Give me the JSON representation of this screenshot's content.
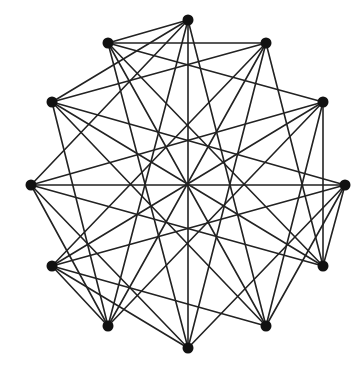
{
  "diagram": {
    "type": "graph",
    "directed": false,
    "colors": {
      "edge": "#222222",
      "node": "#111111",
      "background": "#ffffff"
    },
    "node_radius": 5.5,
    "nodes": [
      {
        "id": "V0",
        "x": 188,
        "y": 20
      },
      {
        "id": "V1",
        "x": 266,
        "y": 43
      },
      {
        "id": "V2",
        "x": 323,
        "y": 102
      },
      {
        "id": "V3",
        "x": 345,
        "y": 185
      },
      {
        "id": "V4",
        "x": 323,
        "y": 266
      },
      {
        "id": "V5",
        "x": 266,
        "y": 326
      },
      {
        "id": "V6",
        "x": 188,
        "y": 348
      },
      {
        "id": "V7",
        "x": 108,
        "y": 326
      },
      {
        "id": "V8",
        "x": 52,
        "y": 266
      },
      {
        "id": "V9",
        "x": 31,
        "y": 185
      },
      {
        "id": "V10",
        "x": 52,
        "y": 102
      },
      {
        "id": "V11",
        "x": 108,
        "y": 43
      }
    ],
    "edges": [
      [
        "V0",
        "V5"
      ],
      [
        "V0",
        "V6"
      ],
      [
        "V0",
        "V7"
      ],
      [
        "V0",
        "V9"
      ],
      [
        "V0",
        "V10"
      ],
      [
        "V0",
        "V11"
      ],
      [
        "V1",
        "V4"
      ],
      [
        "V1",
        "V6"
      ],
      [
        "V1",
        "V7"
      ],
      [
        "V1",
        "V8"
      ],
      [
        "V1",
        "V10"
      ],
      [
        "V1",
        "V11"
      ],
      [
        "V2",
        "V4"
      ],
      [
        "V2",
        "V5"
      ],
      [
        "V2",
        "V7"
      ],
      [
        "V2",
        "V8"
      ],
      [
        "V2",
        "V9"
      ],
      [
        "V2",
        "V11"
      ],
      [
        "V3",
        "V4"
      ],
      [
        "V3",
        "V5"
      ],
      [
        "V3",
        "V6"
      ],
      [
        "V3",
        "V8"
      ],
      [
        "V3",
        "V9"
      ],
      [
        "V3",
        "V10"
      ],
      [
        "V4",
        "V9"
      ],
      [
        "V4",
        "V10"
      ],
      [
        "V4",
        "V11"
      ],
      [
        "V5",
        "V8"
      ],
      [
        "V5",
        "V10"
      ],
      [
        "V5",
        "V11"
      ],
      [
        "V6",
        "V8"
      ],
      [
        "V6",
        "V9"
      ],
      [
        "V6",
        "V11"
      ],
      [
        "V7",
        "V8"
      ],
      [
        "V7",
        "V9"
      ],
      [
        "V7",
        "V10"
      ]
    ]
  }
}
